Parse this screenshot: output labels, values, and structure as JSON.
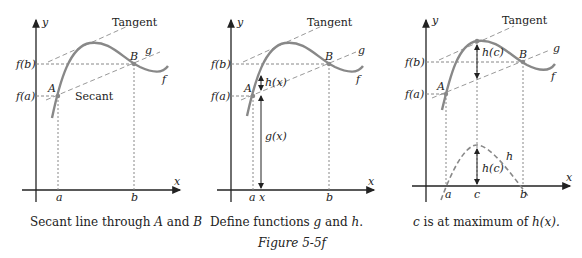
{
  "figure": {
    "label": "Figure 5-5f",
    "colors": {
      "curve": "#888888",
      "axis": "#222222",
      "dash": "#999999"
    }
  },
  "panels": [
    {
      "caption_pre": "Secant line through ",
      "caption_A": "A",
      "caption_mid": " and ",
      "caption_B": "B",
      "labels": {
        "y": "y",
        "x": "x",
        "tangent": "Tangent",
        "g": "g",
        "f": "f",
        "fb": "f(b)",
        "fa": "f(a)",
        "A": "A",
        "B": "B",
        "secant": "Secant",
        "a": "a",
        "b": "b"
      }
    },
    {
      "caption_pre": "Define functions ",
      "caption_g": "g",
      "caption_mid": " and ",
      "caption_h": "h",
      "caption_post": ".",
      "labels": {
        "y": "y",
        "x": "x",
        "tangent": "Tangent",
        "g": "g",
        "f": "f",
        "fb": "f(b)",
        "fa": "f(a)",
        "A": "A",
        "B": "B",
        "hx": "h(x)",
        "gx": "g(x)",
        "a": "a",
        "xt": "x",
        "b": "b"
      }
    },
    {
      "caption_c": "c",
      "caption_mid": " is at maximum of ",
      "caption_h": "h(x).",
      "labels": {
        "y": "y",
        "x": "x",
        "tangent": "Tangent",
        "g": "g",
        "f": "f",
        "fb": "f(b)",
        "fa": "f(a)",
        "A": "A",
        "B": "B",
        "hc": "h(c)",
        "hc2": "h(c)",
        "h": "h",
        "a": "a",
        "c": "c",
        "b": "b"
      }
    }
  ]
}
